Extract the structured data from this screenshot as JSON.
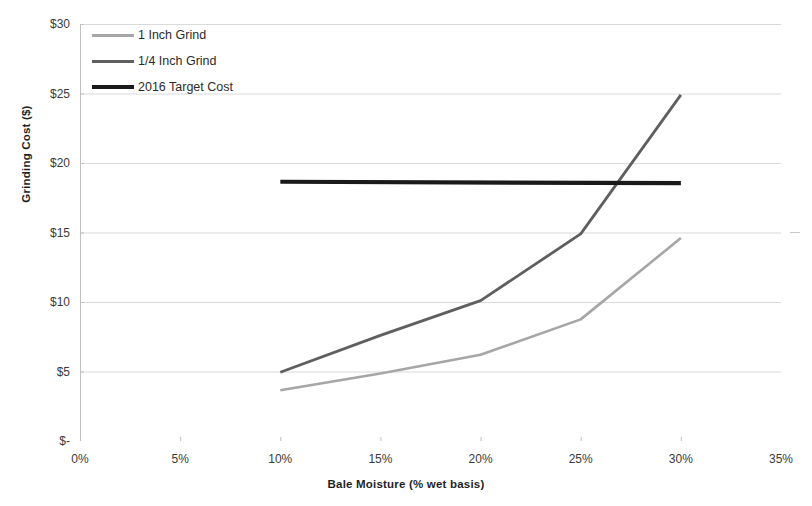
{
  "chart_data": {
    "type": "line",
    "title": "",
    "xlabel": "Bale Moisture (% wet basis)",
    "ylabel": "Grinding Cost ($)",
    "xlim": [
      0,
      35
    ],
    "ylim": [
      0,
      30
    ],
    "grid": "horizontal",
    "legend_position": "top-left inside plot",
    "xtick_labels": [
      "0%",
      "5%",
      "10%",
      "15%",
      "20%",
      "25%",
      "30%",
      "35%"
    ],
    "xtick_values": [
      0,
      5,
      10,
      15,
      20,
      25,
      30,
      35
    ],
    "ytick_labels": [
      "$-",
      "$5",
      "$10",
      "$15",
      "$20",
      "$25",
      "$30"
    ],
    "ytick_values": [
      0,
      5,
      10,
      15,
      20,
      25,
      30
    ],
    "series": [
      {
        "name": "1 Inch Grind",
        "color": "#a6a6a6",
        "width": 2.6,
        "x": [
          10,
          15,
          20,
          25,
          30
        ],
        "values": [
          3.65,
          4.85,
          6.2,
          8.75,
          14.6
        ]
      },
      {
        "name": "1/4 Inch Grind",
        "color": "#5f5f5f",
        "width": 2.8,
        "x": [
          10,
          15,
          20,
          25,
          30
        ],
        "values": [
          4.95,
          7.6,
          10.1,
          14.9,
          24.9
        ]
      },
      {
        "name": "2016 Target Cost",
        "color": "#1a1a1a",
        "width": 4.2,
        "x": [
          10,
          30
        ],
        "values": [
          18.65,
          18.55
        ]
      }
    ]
  },
  "legend": {
    "items": [
      {
        "label": "1 Inch Grind"
      },
      {
        "label": "1/4 Inch Grind"
      },
      {
        "label": "2016 Target Cost"
      }
    ]
  },
  "colors": {
    "gridline": "#d9d9d9",
    "axis": "#bfbfbf",
    "text": "#2b2b2b"
  }
}
